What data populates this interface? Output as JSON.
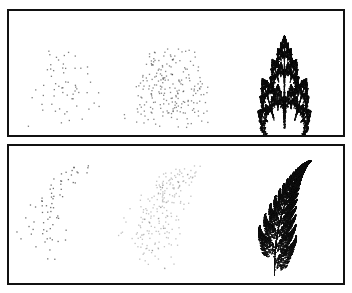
{
  "figure": {
    "panels": [
      {
        "id": "top",
        "subject": "fractal tree",
        "ifs": "tree",
        "frames": [
          {
            "label": "sparse",
            "points": 60,
            "alpha": 0.55
          },
          {
            "label": "medium",
            "points": 220,
            "alpha": 0.5
          },
          {
            "label": "dense",
            "points": 60000,
            "alpha": 0.35
          }
        ]
      },
      {
        "id": "bottom",
        "subject": "fern",
        "ifs": "fern",
        "frames": [
          {
            "label": "sparse",
            "points": 70,
            "alpha": 0.6
          },
          {
            "label": "medium",
            "points": 220,
            "alpha": 0.25
          },
          {
            "label": "dense",
            "points": 60000,
            "alpha": 0.45
          }
        ]
      }
    ],
    "colors": {
      "ink": "#111111",
      "border": "#111111",
      "background": "#ffffff"
    }
  }
}
